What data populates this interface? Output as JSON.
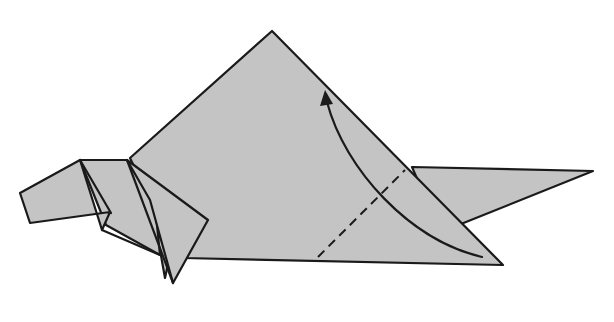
{
  "diagram": {
    "type": "origami-instruction-step",
    "paper_color": "#c4c4c4",
    "line_color": "#1a1a1a",
    "background": "#ffffff",
    "annotations": [
      {
        "kind": "valley-fold-line",
        "style": "dashed",
        "from": [
          318,
          257
        ],
        "to": [
          405,
          170
        ]
      },
      {
        "kind": "fold-arrow",
        "direction": "up-left",
        "from": [
          482,
          257
        ],
        "to": [
          325,
          93
        ]
      }
    ],
    "parts": [
      "head",
      "neck",
      "leg",
      "body-flap",
      "tail"
    ]
  }
}
